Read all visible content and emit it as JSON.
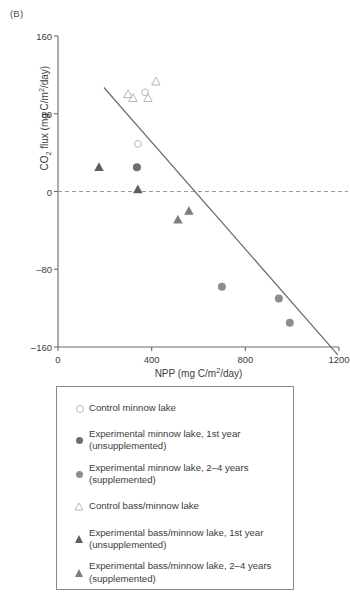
{
  "panel": {
    "label": "(B)"
  },
  "chart_data": {
    "type": "scatter",
    "title": "",
    "xlabel": "NPP (mg C/m2/day)",
    "ylabel": "CO2 flux (mg C/m2/day)",
    "xlim": [
      0,
      1200
    ],
    "ylim": [
      -160,
      160
    ],
    "xticks": [
      0,
      400,
      800,
      1200
    ],
    "yticks": [
      160,
      80,
      0,
      -80,
      -160
    ],
    "grid": false,
    "zero_reference_line": 0,
    "regression_line": {
      "x": [
        196,
        1195
      ],
      "y": [
        107,
        -168
      ]
    },
    "series": [
      {
        "name": "Control minnow lake",
        "marker": "circle-open",
        "color": "#b7b7b7",
        "points": [
          {
            "x": 372,
            "y": 102
          },
          {
            "x": 341,
            "y": 49
          }
        ]
      },
      {
        "name": "Experimental minnow lake, 1st year (unsupplemented)",
        "marker": "circle-filled-dark",
        "color": "#6e6e6e",
        "points": [
          {
            "x": 337,
            "y": 25
          }
        ]
      },
      {
        "name": "Experimental minnow lake, 2-4 years (supplemented)",
        "marker": "circle-filled-mid",
        "color": "#8d8d8d",
        "points": [
          {
            "x": 700,
            "y": -98
          },
          {
            "x": 943,
            "y": -110
          },
          {
            "x": 990,
            "y": -135
          }
        ]
      },
      {
        "name": "Control bass/minnow lake",
        "marker": "triangle-open",
        "color": "#b7b7b7",
        "points": [
          {
            "x": 299,
            "y": 100
          },
          {
            "x": 320,
            "y": 96
          },
          {
            "x": 384,
            "y": 96
          },
          {
            "x": 418,
            "y": 113
          }
        ]
      },
      {
        "name": "Experimental bass/minnow lake, 1st year (unsupplemented)",
        "marker": "triangle-filled-dark",
        "color": "#5f5f5f",
        "points": [
          {
            "x": 175,
            "y": 25
          },
          {
            "x": 341,
            "y": 2
          }
        ]
      },
      {
        "name": "Experimental bass/minnow lake, 2-4 years (supplemented)",
        "marker": "triangle-filled-mid",
        "color": "#7e7e7e",
        "points": [
          {
            "x": 512,
            "y": -29
          },
          {
            "x": 559,
            "y": -20
          }
        ]
      }
    ]
  },
  "axes": {
    "y_title_html": "CO<sub>2</sub> flux (mg C/m<sup>2</sup>/day)",
    "x_title_html": "NPP (mg C/m<sup>2</sup>/day)",
    "ytick_labels": [
      "160",
      "80",
      "0",
      "–80",
      "–160"
    ],
    "xtick_labels": [
      "0",
      "400",
      "800",
      "1200"
    ]
  },
  "legend": {
    "items": [
      {
        "marker": "circle-open",
        "label": "Control minnow lake"
      },
      {
        "marker": "circle-filled-dark",
        "label": "Experimental minnow lake, 1st year\n(unsupplemented)"
      },
      {
        "marker": "circle-filled-mid",
        "label": "Experimental minnow lake, 2–4 years\n(supplemented)"
      },
      {
        "marker": "triangle-open",
        "label": "Control bass/minnow lake"
      },
      {
        "marker": "triangle-filled-dark",
        "label": "Experimental bass/minnow lake, 1st year\n(unsupplemented)"
      },
      {
        "marker": "triangle-filled-mid",
        "label": "Experimental bass/minnow lake, 2–4 years\n(supplemented)"
      }
    ]
  },
  "colors": {
    "axis": "#6b6b6b",
    "text": "#3c3c3c",
    "regression": "#6b6b6b",
    "zero_line": "#9a9a9a"
  }
}
